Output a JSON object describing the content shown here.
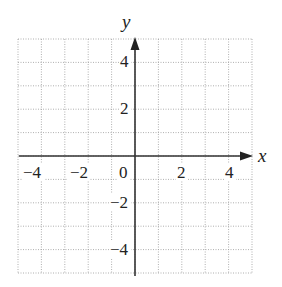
{
  "chart_data": {
    "type": "scatter",
    "title": "",
    "xlabel": "x",
    "ylabel": "y",
    "xlim": [
      -5,
      5
    ],
    "ylim": [
      -5,
      5
    ],
    "grid": true,
    "grid_style": "dotted",
    "grid_step": 1,
    "x_ticks": [
      -4,
      -2,
      0,
      2,
      4
    ],
    "y_ticks": [
      4,
      2,
      -2,
      -4
    ],
    "x_tick_labels": [
      "−4",
      "−2",
      "0",
      "2",
      "4"
    ],
    "y_tick_labels": [
      "4",
      "2",
      "−2",
      "−4"
    ],
    "series": [],
    "legend": null
  },
  "labels": {
    "x_axis": "x",
    "y_axis": "y",
    "origin": "0",
    "x_neg4": "−4",
    "x_neg2": "−2",
    "x_2": "2",
    "x_4": "4",
    "y_4": "4",
    "y_2": "2",
    "y_neg2": "−2",
    "y_neg4": "−4"
  },
  "colors": {
    "grid": "#9a9a9a",
    "axis": "#333333",
    "text": "#222222"
  }
}
